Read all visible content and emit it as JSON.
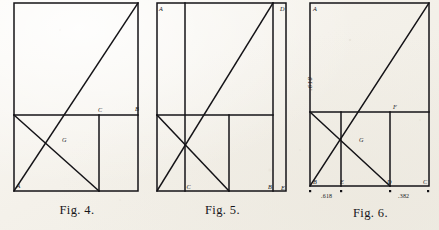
{
  "plate": {
    "kind": "geometric-construction-plate",
    "paper_color": "#f4f1ea",
    "ink_color": "#141317",
    "figure_count": 3
  },
  "figures": [
    {
      "id": "fig4",
      "caption": "Fig. 4.",
      "points": [
        {
          "label": "A",
          "x": 0.035,
          "y": 0.955
        },
        {
          "label": "G",
          "x": 0.385,
          "y": 0.715
        },
        {
          "label": "C",
          "x": 0.665,
          "y": 0.565
        },
        {
          "label": "B",
          "x": 0.955,
          "y": 0.558
        }
      ],
      "measures": []
    },
    {
      "id": "fig5",
      "caption": "Fig. 5.",
      "points": [
        {
          "label": "A",
          "x": 0.035,
          "y": 0.045
        },
        {
          "label": "D",
          "x": 0.955,
          "y": 0.042
        },
        {
          "label": "C",
          "x": 0.215,
          "y": 0.955
        },
        {
          "label": "B",
          "x": 0.845,
          "y": 0.955
        },
        {
          "label": "E",
          "x": 0.962,
          "y": 0.958
        }
      ],
      "measures": []
    },
    {
      "id": "fig6",
      "caption": "Fig. 6.",
      "points": [
        {
          "label": "A",
          "x": 0.045,
          "y": 0.048
        },
        {
          "label": "F",
          "x": 0.705,
          "y": 0.565
        },
        {
          "label": "G",
          "x": 0.425,
          "y": 0.715
        },
        {
          "label": "B",
          "x": 0.048,
          "y": 0.945
        },
        {
          "label": "E",
          "x": 0.265,
          "y": 0.948
        },
        {
          "label": "D",
          "x": 0.645,
          "y": 0.945
        },
        {
          "label": "C",
          "x": 0.955,
          "y": 0.945
        }
      ],
      "measures": [
        {
          "name": "height-ratio",
          "value": ".618",
          "orientation": "vertical"
        },
        {
          "name": "segment-be",
          "value": ".618",
          "orientation": "horizontal"
        },
        {
          "name": "segment-dc",
          "value": ".382",
          "orientation": "horizontal"
        }
      ]
    }
  ]
}
